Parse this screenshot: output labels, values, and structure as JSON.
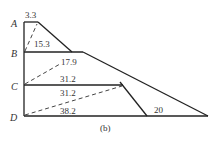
{
  "figure": {
    "caption": "(b)",
    "points": [
      {
        "name": "A",
        "label": "A"
      },
      {
        "name": "B",
        "label": "B"
      },
      {
        "name": "C",
        "label": "C"
      },
      {
        "name": "D",
        "label": "D"
      }
    ],
    "values": {
      "top_width": "3.3",
      "ab_diag": "15.3",
      "b_level": "17.9",
      "c_upper": "31.2",
      "c_lower": "31.2",
      "d_diag": "38.2",
      "right_base": "20"
    },
    "colors": {
      "line": "#222222",
      "text": "#333333",
      "background": "#ffffff"
    }
  }
}
